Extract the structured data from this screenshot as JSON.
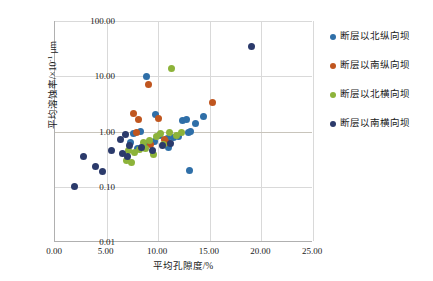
{
  "chart_data": {
    "type": "scatter",
    "title": "",
    "xlabel": "平均孔隙度/%",
    "ylabel": "平均溶蚀率/×10⁻¹ μm",
    "ylabel_base": "平均溶蚀率/×10",
    "ylabel_exp": "-1",
    "ylabel_unit": " μm",
    "xlim": [
      0,
      25
    ],
    "ylim": [
      0.01,
      100
    ],
    "yscale": "log",
    "xticks": [
      "0.00",
      "5.00",
      "10.00",
      "15.00",
      "20.00",
      "25.00"
    ],
    "xtick_values": [
      0,
      5,
      10,
      15,
      20,
      25
    ],
    "yticks": [
      "0.01",
      "0.10",
      "1.00",
      "10.00",
      "100.00"
    ],
    "ytick_values": [
      0.01,
      0.1,
      1,
      10,
      100
    ],
    "grid": "both",
    "legend_position": "right",
    "series": [
      {
        "name": "断层以北纵向坝",
        "color": "#2f6fa8",
        "points": [
          [
            8.9,
            9.9
          ],
          [
            7.6,
            0.92
          ],
          [
            8.3,
            1.02
          ],
          [
            9.6,
            0.66
          ],
          [
            9.0,
            0.61
          ],
          [
            10.1,
            0.86
          ],
          [
            10.9,
            0.75
          ],
          [
            11.5,
            0.77
          ],
          [
            12.0,
            0.8
          ],
          [
            12.4,
            1.55
          ],
          [
            12.7,
            1.62
          ],
          [
            13.6,
            1.4
          ],
          [
            13.1,
            1.0
          ],
          [
            12.9,
            0.95
          ],
          [
            14.4,
            1.85
          ],
          [
            13.0,
            0.2
          ],
          [
            9.7,
            2.05
          ],
          [
            7.3,
            0.63
          ],
          [
            8.0,
            0.5
          ],
          [
            11.0,
            0.52
          ]
        ]
      },
      {
        "name": "断层以南纵向坝",
        "color": "#c0561f",
        "points": [
          [
            9.1,
            7.1
          ],
          [
            7.6,
            2.1
          ],
          [
            8.1,
            1.65
          ],
          [
            10.0,
            1.7
          ],
          [
            10.6,
            0.72
          ],
          [
            10.8,
            0.62
          ],
          [
            15.3,
            3.35
          ],
          [
            9.3,
            0.58
          ],
          [
            7.9,
            0.95
          ]
        ]
      },
      {
        "name": "断层以北横向坝",
        "color": "#8db33a",
        "points": [
          [
            11.3,
            14.0
          ],
          [
            11.1,
            0.96
          ],
          [
            10.2,
            0.93
          ],
          [
            9.8,
            0.8
          ],
          [
            9.2,
            0.7
          ],
          [
            8.6,
            0.62
          ],
          [
            8.2,
            0.48
          ],
          [
            7.7,
            0.41
          ],
          [
            7.1,
            0.45
          ],
          [
            6.9,
            0.3
          ],
          [
            8.8,
            0.5
          ],
          [
            10.5,
            0.58
          ],
          [
            11.8,
            0.86
          ],
          [
            12.3,
            0.96
          ],
          [
            9.5,
            0.38
          ],
          [
            7.4,
            0.27
          ]
        ]
      },
      {
        "name": "断层以南横向坝",
        "color": "#2b3a6b",
        "points": [
          [
            19.0,
            35.0
          ],
          [
            1.9,
            0.1
          ],
          [
            2.8,
            0.36
          ],
          [
            3.9,
            0.23
          ],
          [
            4.6,
            0.19
          ],
          [
            5.5,
            0.46
          ],
          [
            6.3,
            0.72
          ],
          [
            6.8,
            0.88
          ],
          [
            7.2,
            0.56
          ],
          [
            8.4,
            0.52
          ],
          [
            9.4,
            0.45
          ],
          [
            10.4,
            0.55
          ],
          [
            11.2,
            0.6
          ],
          [
            6.5,
            0.4
          ],
          [
            7.0,
            0.35
          ]
        ]
      }
    ]
  },
  "legend": {
    "items": [
      {
        "label": "断层以北纵向坝",
        "color": "#2f6fa8"
      },
      {
        "label": "断层以南纵向坝",
        "color": "#c0561f"
      },
      {
        "label": "断层以北横向坝",
        "color": "#8db33a"
      },
      {
        "label": "断层以南横向坝",
        "color": "#2b3a6b"
      }
    ]
  }
}
